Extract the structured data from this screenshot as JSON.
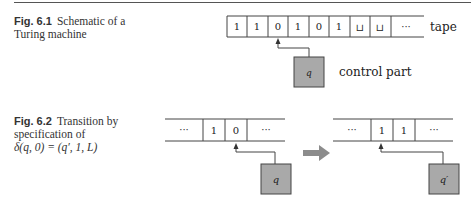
{
  "figures": [
    {
      "label": "Fig. 6.1",
      "caption_line1": "Schematic of a",
      "caption_line2": "Turing machine",
      "tape_cells": [
        "1",
        "1",
        "0",
        "1",
        "0",
        "1",
        "⊔",
        "⊔",
        "···"
      ],
      "tape_label": "tape",
      "state": "q",
      "control_label": "control part"
    },
    {
      "label": "Fig. 6.2",
      "caption_line1": "Transition by",
      "caption_line2": "specification of",
      "caption_line3": "δ(q, 0) = (q′, 1, L)",
      "before": {
        "cells": [
          "···",
          "1",
          "0",
          "···"
        ],
        "state": "q"
      },
      "after": {
        "cells": [
          "···",
          "1",
          "1",
          "···"
        ],
        "state": "q′"
      },
      "arrow": "right-arrow"
    }
  ],
  "colors": {
    "box_fill": "#a9a9a9",
    "arrow_fill": "#8c8c8c",
    "line": "#444444"
  }
}
